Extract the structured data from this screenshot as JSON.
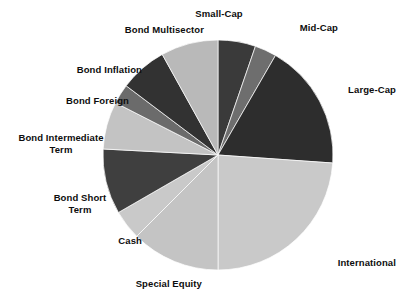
{
  "chart_data": {
    "type": "pie",
    "title": "",
    "subtitle": "",
    "xlabel": "",
    "ylabel": "",
    "legend_position": "none",
    "grid": false,
    "label_style": "outside-callout",
    "start_angle_deg": 0,
    "direction": "clockwise",
    "center": {
      "x": 218,
      "y": 155
    },
    "radius": 115,
    "categories": [
      "Small-Cap",
      "Mid-Cap",
      "Large-Cap",
      "International",
      "Special Equity",
      "Cash",
      "Bond Short Term",
      "Bond Intermediate Term",
      "Bond Foreign",
      "Bond Inflation",
      "Bond Multisector"
    ],
    "values": [
      5.3,
      3.1,
      17.8,
      23.9,
      12.5,
      4.2,
      9.2,
      6.7,
      2.8,
      6.7,
      8.1
    ],
    "angles_deg": [
      19,
      11,
      64,
      86,
      45,
      15,
      33,
      24,
      10,
      24,
      29
    ],
    "colors": [
      "#3a3a3a",
      "#6e6e6e",
      "#2d2d2d",
      "#c9c9c9",
      "#c4c4c4",
      "#c9c9c9",
      "#3f3f3f",
      "#c3c3c3",
      "#6b6b6b",
      "#323232",
      "#b9b9b9"
    ],
    "slices": [
      {
        "label": "Small-Cap",
        "value": 5.3,
        "angle_deg": 19,
        "color": "#3a3a3a"
      },
      {
        "label": "Mid-Cap",
        "value": 3.1,
        "angle_deg": 11,
        "color": "#6e6e6e"
      },
      {
        "label": "Large-Cap",
        "value": 17.8,
        "angle_deg": 64,
        "color": "#2d2d2d"
      },
      {
        "label": "International",
        "value": 23.9,
        "angle_deg": 86,
        "color": "#c9c9c9"
      },
      {
        "label": "Special Equity",
        "value": 12.5,
        "angle_deg": 45,
        "color": "#c4c4c4"
      },
      {
        "label": "Cash",
        "value": 4.2,
        "angle_deg": 15,
        "color": "#c9c9c9"
      },
      {
        "label": "Bond Short Term",
        "value": 9.2,
        "angle_deg": 33,
        "color": "#3f3f3f"
      },
      {
        "label": "Bond Intermediate Term",
        "value": 6.7,
        "angle_deg": 24,
        "color": "#c3c3c3"
      },
      {
        "label": "Bond Foreign",
        "value": 2.8,
        "angle_deg": 10,
        "color": "#6b6b6b"
      },
      {
        "label": "Bond Inflation",
        "value": 6.7,
        "angle_deg": 24,
        "color": "#323232"
      },
      {
        "label": "Bond Multisector",
        "value": 8.1,
        "angle_deg": 29,
        "color": "#b9b9b9"
      }
    ]
  },
  "labels": {
    "small_cap": {
      "text": "Small-Cap",
      "x": 219,
      "y": 8,
      "align": "center"
    },
    "mid_cap": {
      "text": "Mid-Cap",
      "x": 278,
      "y": 22,
      "align": "left"
    },
    "large_cap": {
      "text": "Large-Cap",
      "x": 320,
      "y": 84,
      "align": "left"
    },
    "international": {
      "text": "International",
      "x": 306,
      "y": 257,
      "align": "left"
    },
    "special_equity": {
      "text": "Special Equity",
      "x": 102,
      "y": 278,
      "align": "left"
    },
    "cash": {
      "text": "Cash",
      "x": 92,
      "y": 235,
      "align": "left"
    },
    "bond_short_term": {
      "text": "Bond Short\nTerm",
      "x": 39,
      "y": 192,
      "align": "center"
    },
    "bond_intermediate": {
      "text": "Bond Intermediate\nTerm",
      "x": 7,
      "y": 132,
      "align": "center"
    },
    "bond_foreign": {
      "text": "Bond Foreign",
      "x": 37,
      "y": 95,
      "align": "left"
    },
    "bond_inflation": {
      "text": "Bond Inflation",
      "x": 50,
      "y": 64,
      "align": "left"
    },
    "bond_multisector": {
      "text": "Bond Multisector",
      "x": 84,
      "y": 24,
      "align": "left"
    }
  }
}
